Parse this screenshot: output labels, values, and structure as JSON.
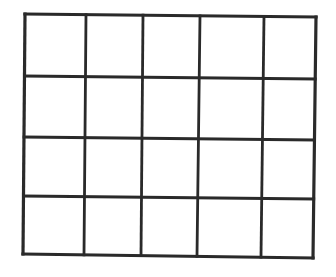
{
  "diagram": {
    "type": "grid",
    "rows": 4,
    "columns": 5,
    "line_color": "#2a2a2a",
    "background": "#ffffff",
    "outer_stroke": 3.2,
    "inner_stroke": 2.8,
    "corners": {
      "top_left": [
        25,
        14
      ],
      "top_right": [
        316,
        17
      ],
      "bottom_left": [
        23,
        254
      ],
      "bottom_right": [
        313,
        258
      ]
    },
    "vertical_lines_top_x": [
      25,
      86,
      143,
      200,
      264,
      316
    ],
    "vertical_lines_bottom_x": [
      23,
      84,
      141,
      197,
      261,
      313
    ],
    "horizontal_lines_left_y": [
      14,
      76,
      137,
      196,
      254
    ],
    "horizontal_lines_right_y": [
      17,
      79,
      140,
      199,
      258
    ]
  }
}
